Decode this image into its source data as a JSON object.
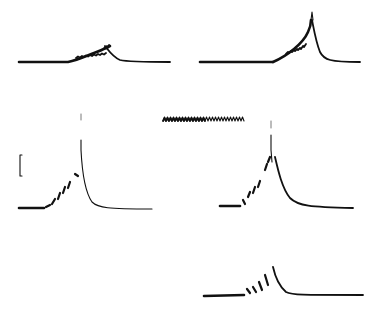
{
  "figure": {
    "background": "#ffffff",
    "ink_color": "#111111",
    "panel_count": 6,
    "text_labels": [],
    "panels": [
      {
        "id": "top-left",
        "description": "baseline with slow hump, small oscillations on rising phase, peak then decay"
      },
      {
        "id": "top-right",
        "description": "baseline with ramping rise and sharp peak then fast decay"
      },
      {
        "id": "middle-left",
        "description": "baseline, stepwise rising dashes, sharp spike then exponential decay"
      },
      {
        "id": "middle-center",
        "description": "periodic stimulus marker (sawtooth train)"
      },
      {
        "id": "middle-right",
        "description": "baseline, stepwise rising dashes, double spike then exponential decay"
      },
      {
        "id": "bottom-right",
        "description": "baseline, four rising dashes, small peak then return to baseline"
      }
    ],
    "scale_bar": {
      "type": "vertical",
      "position": "left-middle"
    },
    "stimulus_train": {
      "cycles": 16
    }
  }
}
